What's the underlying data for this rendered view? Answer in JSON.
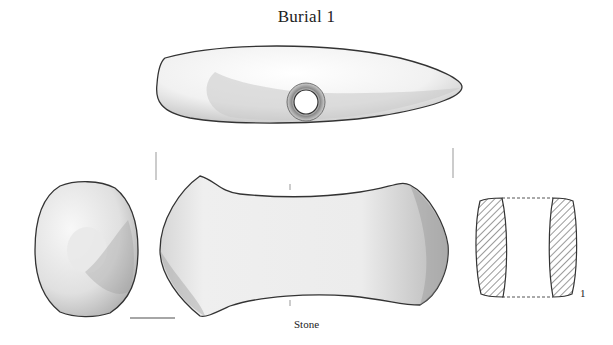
{
  "figure": {
    "title": "Burial 1",
    "caption": "Stone",
    "section_label": "1"
  },
  "views": [
    {
      "name": "top-view",
      "description": "perforated stone axe, plan view with shaft hole"
    },
    {
      "name": "end-view",
      "description": "butt end view"
    },
    {
      "name": "side-view",
      "description": "profile view"
    },
    {
      "name": "cross-section",
      "description": "hatched section through shaft hole"
    }
  ],
  "colors": {
    "ink": "#333333",
    "hatch": "#555555",
    "shade": "#9a9a9a"
  }
}
